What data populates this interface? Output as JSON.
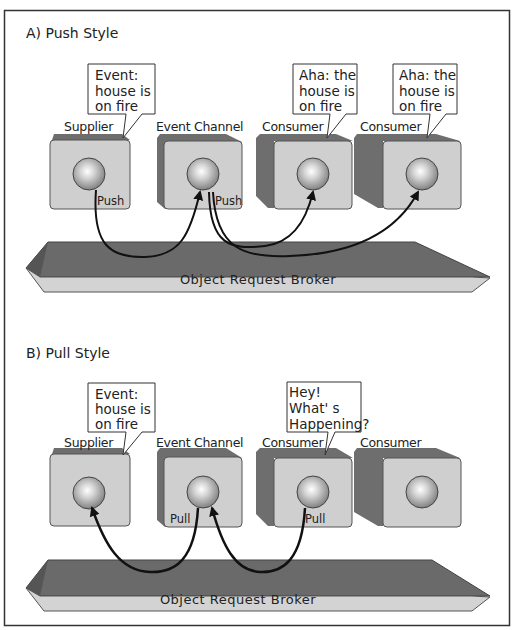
{
  "sections": [
    {
      "title": "A)  Push Style",
      "components": [
        {
          "label": "Supplier",
          "bubble": [
            "Event:",
            "house is",
            "on fire"
          ],
          "action": "Push"
        },
        {
          "label": "Event Channel",
          "bubble": null,
          "action": "Push"
        },
        {
          "label": "Consumer",
          "bubble": [
            "Aha: the",
            "house is",
            "on fire"
          ],
          "action": null
        },
        {
          "label": "Consumer",
          "bubble": [
            "Aha: the",
            "house is",
            "on fire"
          ],
          "action": null
        }
      ],
      "bus_label": "Object Request Broker",
      "flows": [
        {
          "from": "Supplier",
          "to": "Event Channel",
          "type": "push"
        },
        {
          "from": "Event Channel",
          "to": "Consumer 1",
          "type": "push"
        },
        {
          "from": "Event Channel",
          "to": "Consumer 2",
          "type": "push"
        }
      ]
    },
    {
      "title": "B)  Pull Style",
      "components": [
        {
          "label": "Supplier",
          "bubble": [
            "Event:",
            "house is",
            "on fire"
          ],
          "action": null
        },
        {
          "label": "Event Channel",
          "bubble": null,
          "action": "Pull"
        },
        {
          "label": "Consumer",
          "bubble": [
            "Hey!",
            "What' s",
            "Happening?"
          ],
          "action": "Pull"
        },
        {
          "label": "Consumer",
          "bubble": null,
          "action": null
        }
      ],
      "bus_label": "Object Request Broker",
      "flows": [
        {
          "from": "Event Channel",
          "to": "Supplier",
          "type": "pull"
        },
        {
          "from": "Consumer 1",
          "to": "Event Channel",
          "type": "pull"
        }
      ]
    }
  ],
  "colors": {
    "frame": "#333333",
    "box_face": "#cfcfcf",
    "box_side": "#6e6e6e",
    "bus_top": "#6a6a6a",
    "bus_face": "#d3d3d3",
    "arrow": "#111111"
  }
}
